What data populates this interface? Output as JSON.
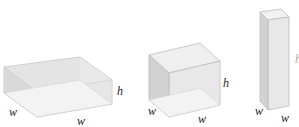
{
  "figure": {
    "boxes": [
      {
        "name": "wide-short-box",
        "labels": {
          "width_left": "w",
          "width_bottom": "w",
          "height": "h"
        }
      },
      {
        "name": "cube-box",
        "labels": {
          "width_left": "w",
          "width_bottom": "w",
          "height": "h"
        }
      },
      {
        "name": "tall-narrow-box",
        "labels": {
          "width_left": "w",
          "width_bottom": "w",
          "height": "h"
        }
      }
    ]
  },
  "colors": {
    "face_light": "#e6e6e6",
    "face_dark": "#cfcfcf",
    "edge": "#b5b5b5",
    "label": "#222222"
  }
}
